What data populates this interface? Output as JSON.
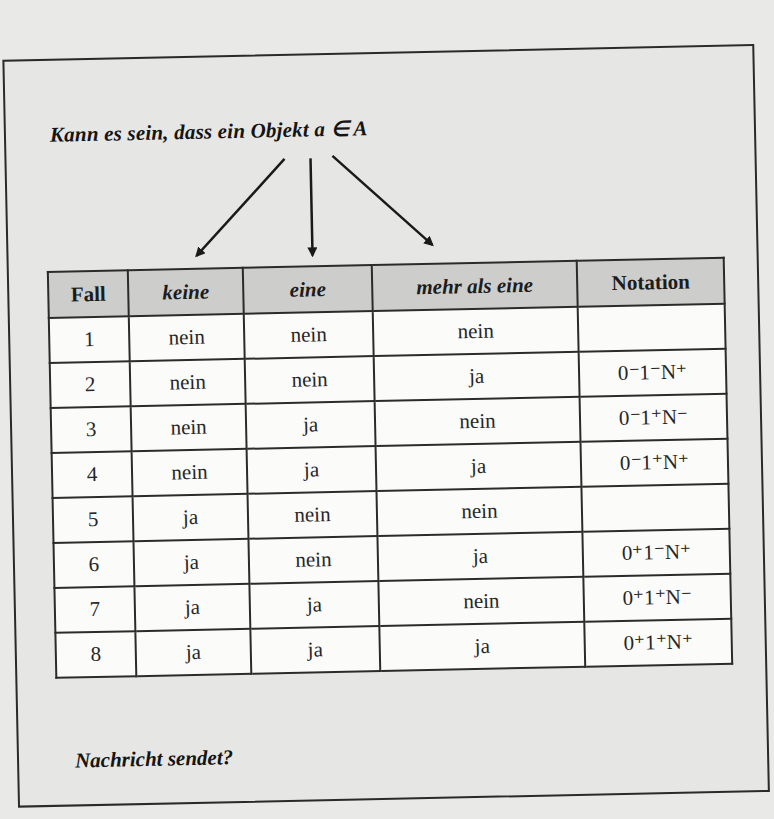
{
  "question_top": "Kann es sein, dass ein Objekt a ∈ A",
  "question_bottom": "Nachricht sendet?",
  "arrows": [
    "arrow-to-keine",
    "arrow-to-eine",
    "arrow-to-mehr-als-eine"
  ],
  "table": {
    "headers": [
      "Fall",
      "keine",
      "eine",
      "mehr als eine",
      "Notation"
    ],
    "rows": [
      {
        "fall": "1",
        "keine": "nein",
        "eine": "nein",
        "mehr": "nein",
        "notation": ""
      },
      {
        "fall": "2",
        "keine": "nein",
        "eine": "nein",
        "mehr": "ja",
        "notation": "0⁻1⁻N⁺"
      },
      {
        "fall": "3",
        "keine": "nein",
        "eine": "ja",
        "mehr": "nein",
        "notation": "0⁻1⁺N⁻"
      },
      {
        "fall": "4",
        "keine": "nein",
        "eine": "ja",
        "mehr": "ja",
        "notation": "0⁻1⁺N⁺"
      },
      {
        "fall": "5",
        "keine": "ja",
        "eine": "nein",
        "mehr": "nein",
        "notation": ""
      },
      {
        "fall": "6",
        "keine": "ja",
        "eine": "nein",
        "mehr": "ja",
        "notation": "0⁺1⁻N⁺"
      },
      {
        "fall": "7",
        "keine": "ja",
        "eine": "ja",
        "mehr": "nein",
        "notation": "0⁺1⁺N⁻"
      },
      {
        "fall": "8",
        "keine": "ja",
        "eine": "ja",
        "mehr": "ja",
        "notation": "0⁺1⁺N⁺"
      }
    ]
  },
  "colors": {
    "paper": "#e6e6e4",
    "header_bg": "#cdcdcb",
    "cell_bg": "#fbfbfa",
    "ink": "#1c1c1c"
  }
}
